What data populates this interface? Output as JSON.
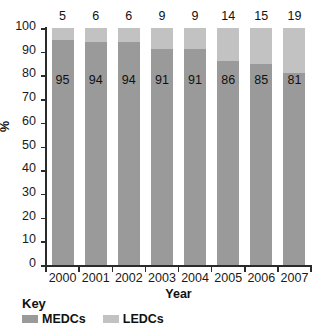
{
  "chart_data": {
    "type": "bar",
    "subtype": "stacked-100-percent",
    "title": "",
    "xlabel": "Year",
    "ylabel": "%",
    "ylim": [
      0,
      100
    ],
    "yticks": [
      0,
      10,
      20,
      30,
      40,
      50,
      60,
      70,
      80,
      90,
      100
    ],
    "grid": false,
    "legend_position": "bottom-left",
    "legend_title": "Key",
    "categories": [
      "2000",
      "2001",
      "2002",
      "2003",
      "2004",
      "2005",
      "2006",
      "2007"
    ],
    "series": [
      {
        "name": "MEDCs",
        "color": "#9a9a9a",
        "stack_position": "bottom",
        "values": [
          95,
          94,
          94,
          91,
          91,
          86,
          85,
          81
        ],
        "labels": [
          "95",
          "94",
          "94",
          "91",
          "91",
          "86",
          "85",
          "81"
        ],
        "label_placement": "inside"
      },
      {
        "name": "LEDCs",
        "color": "#c2c2c2",
        "stack_position": "top",
        "values": [
          5,
          6,
          6,
          9,
          9,
          14,
          15,
          19
        ],
        "labels": [
          "5",
          "6",
          "6",
          "9",
          "9",
          "14",
          "15",
          "19"
        ],
        "label_placement": "above-bar"
      }
    ]
  },
  "axes": {
    "y_tick_labels": [
      "100",
      "90",
      "80",
      "70",
      "60",
      "50",
      "40",
      "30",
      "20",
      "10",
      "0"
    ],
    "y_title": "%",
    "x_tick_labels": [
      "2000",
      "2001",
      "2002",
      "2003",
      "2004",
      "2005",
      "2006",
      "2007"
    ],
    "x_title": "Year"
  },
  "key": {
    "title": "Key",
    "entries": [
      {
        "label": "MEDCs",
        "color": "#9a9a9a"
      },
      {
        "label": "LEDCs",
        "color": "#c2c2c2"
      }
    ]
  }
}
